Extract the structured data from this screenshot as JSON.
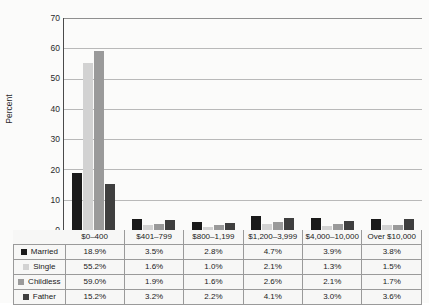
{
  "chart_data": {
    "type": "bar",
    "title": "",
    "subtitle": "",
    "xlabel": "",
    "ylabel": "Percent",
    "ylim": [
      0,
      70
    ],
    "yticks": [
      0,
      10,
      20,
      30,
      40,
      50,
      60,
      70
    ],
    "grid": true,
    "legend_position": "table-row-labels",
    "categories": [
      "$0–400",
      "$401–799",
      "$800–1,199",
      "$1,200–3,999",
      "$4,000–10,000",
      "Over $10,000"
    ],
    "series": [
      {
        "name": "Married",
        "color": "#1a1a1a",
        "values": [
          18.9,
          3.5,
          2.8,
          4.7,
          3.9,
          3.8
        ]
      },
      {
        "name": "Single",
        "color": "#d2d2d2",
        "values": [
          55.2,
          1.6,
          1.0,
          2.1,
          1.3,
          1.5
        ]
      },
      {
        "name": "Childless",
        "color": "#9a9a9a",
        "values": [
          59.0,
          1.9,
          1.6,
          2.6,
          2.1,
          1.7
        ]
      },
      {
        "name": "Father",
        "color": "#3f3f3f",
        "values": [
          15.2,
          3.2,
          2.2,
          4.1,
          3.0,
          3.6
        ]
      }
    ],
    "value_labels": [
      [
        "18.9%",
        "3.5%",
        "2.8%",
        "4.7%",
        "3.9%",
        "3.8%"
      ],
      [
        "55.2%",
        "1.6%",
        "1.0%",
        "2.1%",
        "1.3%",
        "1.5%"
      ],
      [
        "59.0%",
        "1.9%",
        "1.6%",
        "2.6%",
        "2.1%",
        "1.7%"
      ],
      [
        "15.2%",
        "3.2%",
        "2.2%",
        "4.1%",
        "3.0%",
        "3.6%"
      ]
    ]
  },
  "axis": {
    "y_title": "Percent",
    "y_ticks": [
      "70",
      "60",
      "50",
      "40",
      "30",
      "20",
      "10",
      "0"
    ]
  },
  "table": {
    "row_labels": [
      "Married",
      "Single",
      "Childless",
      "Father"
    ]
  }
}
